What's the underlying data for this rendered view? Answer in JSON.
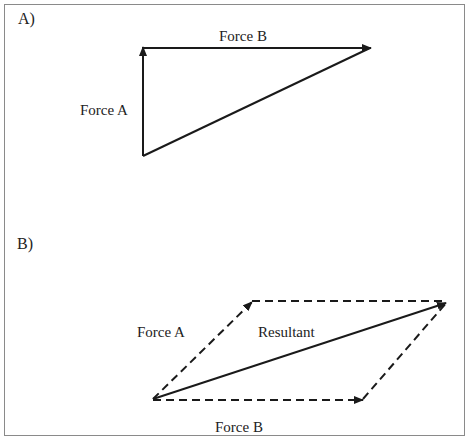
{
  "panels": {
    "a": {
      "label": "A)",
      "force_a_label": "Force A",
      "force_b_label": "Force B"
    },
    "b": {
      "label": "B)",
      "force_a_label": "Force A",
      "force_b_label": "Force B",
      "resultant_label": "Resultant"
    }
  },
  "colors": {
    "line": "#1a1a1a",
    "frame": "#8a8a8a",
    "text": "#222222"
  }
}
